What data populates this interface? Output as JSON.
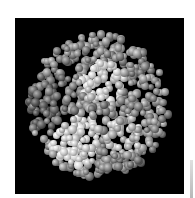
{
  "image": {
    "subject": "protein space-filling molecular model",
    "description": "Grayscale cluster of shaded spheres (atoms) on black background",
    "background": "#000000",
    "border_color": "#ffffff",
    "tones": {
      "dark": "#5a5a5a",
      "mid": "#8c8c8c",
      "light": "#c8c8c8",
      "highlight": "#e6e6e6"
    }
  }
}
